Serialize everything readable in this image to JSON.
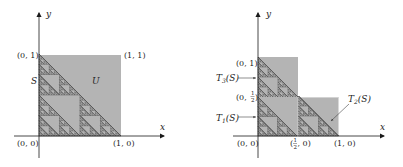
{
  "colors": {
    "fill": "#b4b4b4",
    "fractal": "#5a5a5a",
    "axis": "#1a1a1a",
    "text": "#222222"
  },
  "left_panel": {
    "axis_x_label": "x",
    "axis_y_label": "y",
    "corner_labels": {
      "origin": "(0, 0)",
      "top_left": "(0, 1)",
      "top_right": "(1, 1)",
      "bottom_right": "(1, 0)"
    },
    "set_label_s": "S",
    "set_label_u": "U"
  },
  "right_panel": {
    "axis_x_label": "x",
    "axis_y_label": "y",
    "corner_labels": {
      "origin": "(0, 0)",
      "top_left": "(0, 1)",
      "half_y_prefix": "(0, ",
      "half_y_suffix": ")",
      "half_x_prefix": "(",
      "half_x_suffix": ", 0)",
      "bottom_right": "(1, 0)",
      "half_num": "1",
      "half_den": "2"
    },
    "map_labels": {
      "t1": "T",
      "t1_sub": "1",
      "t2": "T",
      "t2_sub": "2",
      "t3": "T",
      "t3_sub": "3",
      "arg": "(S)"
    }
  },
  "fractal": {
    "depth": 5
  }
}
